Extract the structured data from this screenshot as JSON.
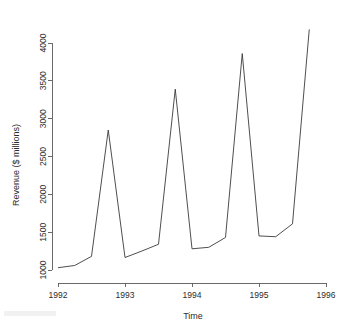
{
  "chart_data": {
    "type": "line",
    "title": "",
    "subtitle": "",
    "xlabel": "Time",
    "ylabel": "Revenue ($ millions)",
    "x": [
      1992.0,
      1992.25,
      1992.5,
      1992.75,
      1993.0,
      1993.25,
      1993.5,
      1993.75,
      1994.0,
      1994.25,
      1994.5,
      1994.75,
      1995.0,
      1995.25,
      1995.5,
      1995.75
    ],
    "values": [
      1030,
      1060,
      1180,
      2850,
      1165,
      1250,
      1340,
      3390,
      1280,
      1300,
      1430,
      3860,
      1450,
      1440,
      1610,
      4180
    ],
    "series": [
      {
        "name": "Revenue",
        "values": [
          1030,
          1060,
          1180,
          2850,
          1165,
          1250,
          1340,
          3390,
          1280,
          1300,
          1430,
          3860,
          1450,
          1440,
          1610,
          4180
        ]
      }
    ],
    "xlim": [
      1991.75,
      1996.1
    ],
    "ylim": [
      950,
      4250
    ],
    "xticks": [
      1992,
      1993,
      1994,
      1995,
      1996
    ],
    "xtick_labels": [
      "1992",
      "1993",
      "1994",
      "1995",
      "1996"
    ],
    "yticks": [
      1000,
      1500,
      2000,
      2500,
      3000,
      3500,
      4000
    ],
    "ytick_labels": [
      "1000",
      "1500",
      "2000",
      "2500",
      "3000",
      "3500",
      "4000"
    ],
    "grid": false,
    "legend": false,
    "legend_position": "none",
    "line_color": "#3a3a3a",
    "background_color": "#ffffff",
    "axis_color": "#5a5a5a"
  },
  "axes": {
    "x_title": "Time",
    "y_title": "Revenue ($ millions)"
  }
}
